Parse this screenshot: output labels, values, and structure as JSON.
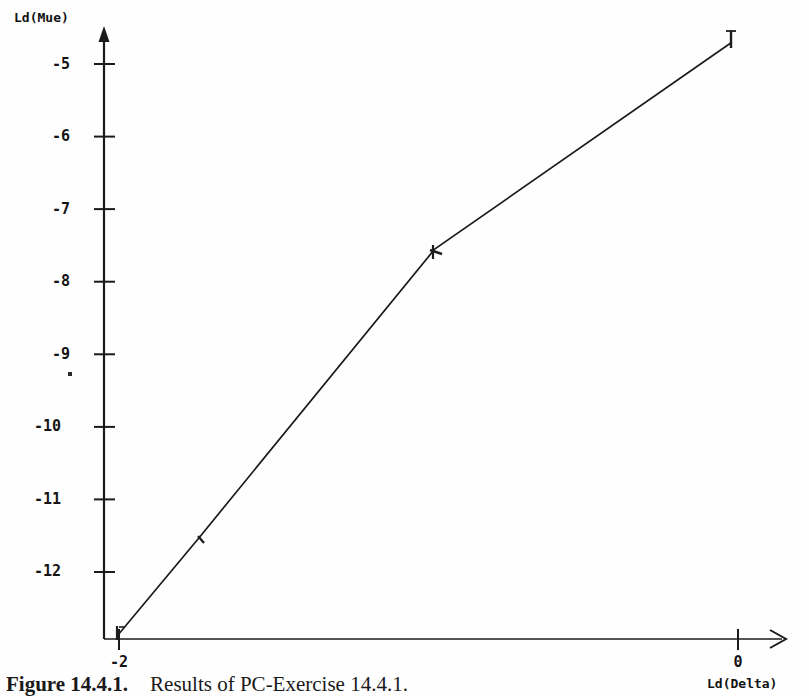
{
  "figure": {
    "caption_number": "Figure 14.4.1.",
    "caption_text": "Results of PC-Exercise 14.4.1."
  },
  "chart_data": {
    "type": "line",
    "title": "",
    "xlabel": "Ld(Delta)",
    "ylabel": "Ld(Mue)",
    "xlim": [
      -2.05,
      0.12
    ],
    "ylim": [
      -13.0,
      -4.35
    ],
    "grid": false,
    "legend": null,
    "x_ticks": [
      -2,
      0
    ],
    "x_tick_labels": [
      "-2",
      "0"
    ],
    "y_ticks": [
      -5,
      -6,
      -7,
      -8,
      -9,
      -10,
      -11,
      -12
    ],
    "y_tick_labels": [
      "-5",
      "-6",
      "-7",
      "-8",
      "-9",
      "-10",
      "-11",
      "-12"
    ],
    "series": [
      {
        "name": "Ld(Mue) vs Ld(Delta)",
        "color": "#1a1a1a",
        "marker": "tick",
        "x": [
          -2.0,
          -1.74,
          -0.98,
          -0.02
        ],
        "y": [
          -12.85,
          -11.52,
          -7.55,
          -4.7
        ]
      }
    ]
  },
  "axes": {
    "y_axis_name": "Ld(Mue)",
    "x_axis_name": "Ld(Delta)",
    "y_arrow": "arrow-up",
    "x_arrow": "arrow-right"
  }
}
